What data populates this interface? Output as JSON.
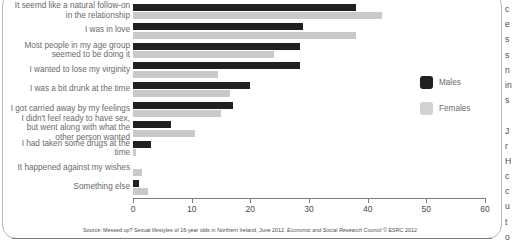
{
  "chart_data": {
    "type": "bar",
    "orientation": "horizontal",
    "title": "",
    "xlabel": "",
    "ylabel": "",
    "xlim": [
      0,
      60
    ],
    "xticks": [
      0,
      10,
      20,
      30,
      40,
      50,
      60
    ],
    "grid": false,
    "legend_position": "right",
    "categories": [
      "It seemd like a natural follow-on in the relationship",
      "I was in love",
      "Most people in my age group seemed to be doing it",
      "I wanted to lose my virginity",
      "I was a bit drunk at the time",
      "I got carried away by my feelings",
      "I didn't feel ready to have sex, but went along with what the other person wanted",
      "I had taken some drugs at the time",
      "It happened against my wishes",
      "Something else"
    ],
    "series": [
      {
        "name": "Males",
        "color": "#231f20",
        "values": [
          38.0,
          29.0,
          28.5,
          28.5,
          20.0,
          17.0,
          6.5,
          3.0,
          0.0,
          1.0
        ]
      },
      {
        "name": "Females",
        "color": "#c9c9c9",
        "values": [
          42.5,
          38.0,
          24.0,
          14.5,
          16.5,
          15.0,
          10.5,
          0.5,
          1.5,
          2.5
        ]
      }
    ],
    "source": "Source: Messed up? Sexual lifestyles of 16-year olds in Northern Ireland, June 2012, Economic and Social Research Council © ESRC 2012"
  },
  "legend": {
    "items": [
      {
        "label": "Males"
      },
      {
        "label": "Females"
      }
    ]
  },
  "source_note": {
    "prefix": "Source: Messed up? Sexual lifestyles of 16-year olds in Northern Ireland, June 2012, ",
    "italic": "Economic and Social Research Council",
    "suffix": " © ESRC 2012"
  },
  "side_text_column": {
    "lines": [
      "c",
      "e",
      "s",
      "s",
      "n",
      "in",
      "s",
      "",
      "J",
      "r",
      "H",
      "c",
      "c",
      "u",
      "t",
      "o"
    ]
  },
  "colors": {
    "male": "#231f20",
    "female": "#c9c9c9",
    "axis": "#7d7d7d",
    "label_text": "#6a6a6a",
    "frame_border": "#b9b9b9"
  }
}
